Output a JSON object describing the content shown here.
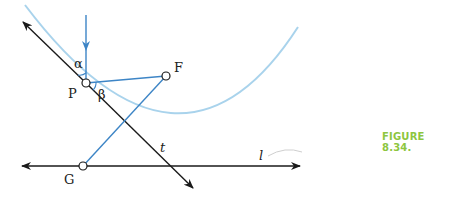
{
  "figure": {
    "caption": "FIGURE 8.34.",
    "caption_color": "#8dc63f",
    "curve_color": "#a9d3ec",
    "ray_color": "#3d85c6",
    "line_color": "#1a1a1a"
  },
  "labels": {
    "alpha": "α",
    "beta": "β",
    "point_p": "P",
    "point_f": "F",
    "point_g": "G",
    "line_t": "t",
    "line_l": "l"
  }
}
